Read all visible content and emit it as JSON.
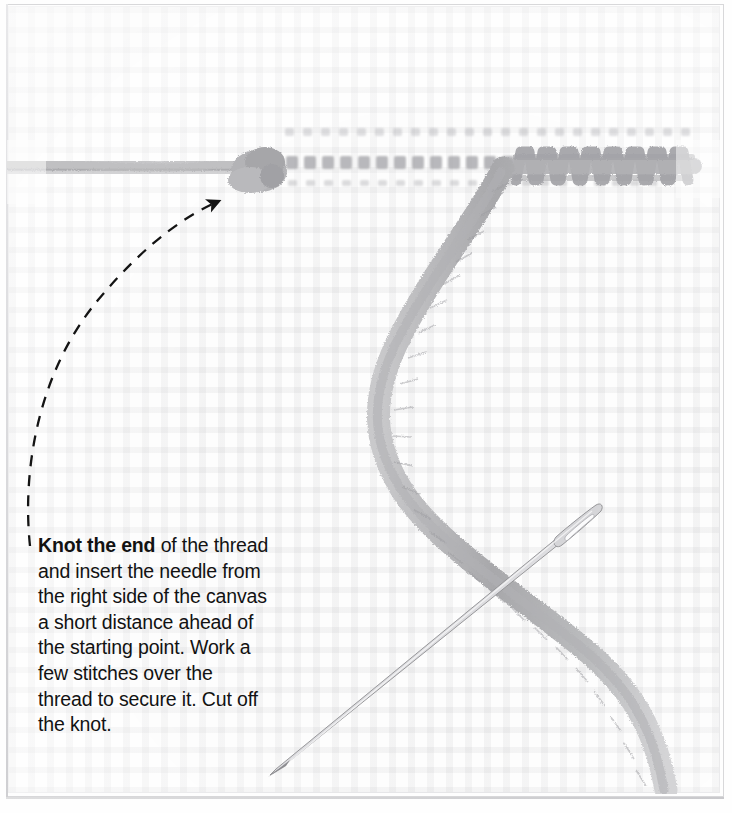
{
  "figure": {
    "caption": {
      "lead": "Knot the end",
      "rest": " of the thread and insert the needle from the right side of the canvas a short distance ahead of the starting point. Work a few stitches over the thread to secure it. Cut off the knot."
    },
    "colors": {
      "background": "#fdfdfd",
      "canvas_grid": "#8c8c91",
      "thread": "#b6b6b8",
      "thread_dark": "#9a9a9d",
      "needle": "#c9c9cc",
      "needle_outline": "#8f8f93",
      "arrow": "#141414",
      "text": "#121212",
      "frame": "#d8d8da"
    },
    "elements": {
      "knot_label": "knot",
      "thread_label": "thread",
      "needle_label": "needle",
      "stitches_label": "stitches",
      "tacking_dashes_label": "canvas holes",
      "arrow_label": "pointer arrow to knot"
    },
    "counts": {
      "tacking_dashes": 13,
      "completed_stitches": 9
    }
  }
}
